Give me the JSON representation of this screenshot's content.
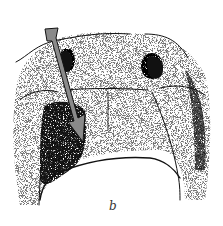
{
  "figure": {
    "panel_label": "b",
    "colors": {
      "ink": "#111111",
      "arrow_fill": "#8a8a8a",
      "background": "#ffffff"
    }
  }
}
